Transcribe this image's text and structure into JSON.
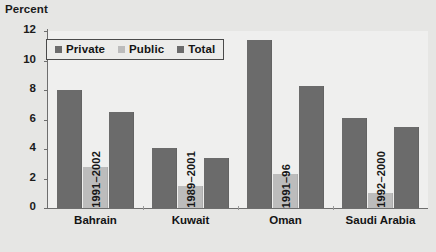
{
  "chart_data": {
    "type": "bar",
    "title": "",
    "subtitle": "",
    "xlabel": "",
    "ylabel": "Percent",
    "ylim": [
      0,
      12
    ],
    "yticks": [
      0,
      2,
      4,
      6,
      8,
      10,
      12
    ],
    "ytick_labels": [
      "0",
      "2",
      "4",
      "6",
      "8",
      "10",
      "12"
    ],
    "grid": false,
    "legend_position": "upper-left-inside",
    "categories": [
      "Bahrain",
      "Kuwait",
      "Oman",
      "Saudi Arabia"
    ],
    "category_periods": [
      "1991–2002",
      "1989–2001",
      "1991–96",
      "1992–2000"
    ],
    "series": [
      {
        "name": "Private",
        "color": "#6b6b6b",
        "values": [
          8.0,
          4.1,
          11.4,
          6.1
        ]
      },
      {
        "name": "Public",
        "color": "#bcbcbc",
        "values": [
          2.75,
          1.5,
          2.3,
          1.0
        ]
      },
      {
        "name": "Total",
        "color": "#6b6b6b",
        "values": [
          6.5,
          3.4,
          8.3,
          5.5
        ]
      }
    ],
    "annotations": [
      {
        "text": "1991–2002",
        "category": "Bahrain",
        "orientation": "vertical"
      },
      {
        "text": "1989–2001",
        "category": "Kuwait",
        "orientation": "vertical"
      },
      {
        "text": "1991–96",
        "category": "Oman",
        "orientation": "vertical"
      },
      {
        "text": "1992–2000",
        "category": "Saudi Arabia",
        "orientation": "vertical"
      }
    ]
  },
  "legend": {
    "items": [
      {
        "label": "Private",
        "color": "#6b6b6b"
      },
      {
        "label": "Public",
        "color": "#bcbcbc"
      },
      {
        "label": "Total",
        "color": "#6b6b6b"
      }
    ]
  },
  "colors": {
    "figure_background": "#e6e6e4",
    "plot_background": "#ececeb",
    "axis": "#6e6e6e",
    "private": "#6b6b6b",
    "public": "#bcbcbc",
    "total": "#6b6b6b",
    "text": "#141414",
    "legend_border": "#4a4a4a"
  }
}
